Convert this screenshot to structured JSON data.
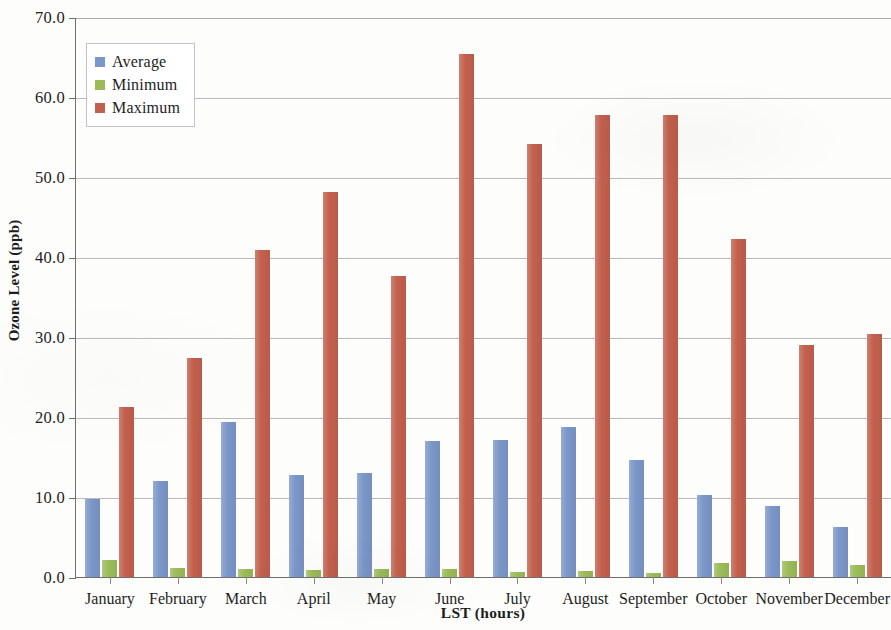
{
  "chart_data": {
    "type": "bar",
    "title": "",
    "xlabel": "LST (hours)",
    "ylabel": "Ozone Level (ppb)",
    "categories": [
      "January",
      "February",
      "March",
      "April",
      "May",
      "June",
      "July",
      "August",
      "September",
      "October",
      "November",
      "December"
    ],
    "series": [
      {
        "name": "Average",
        "color": "#7b96c9",
        "values": [
          9.7,
          12.0,
          19.4,
          12.8,
          13.0,
          17.0,
          17.1,
          18.8,
          14.6,
          10.2,
          8.9,
          6.2
        ]
      },
      {
        "name": "Minimum",
        "color": "#9bbb59",
        "values": [
          2.1,
          1.1,
          1.0,
          0.9,
          1.0,
          1.0,
          0.6,
          0.8,
          0.5,
          1.8,
          2.0,
          1.5
        ]
      },
      {
        "name": "Maximum",
        "color": "#c2604d",
        "values": [
          21.3,
          27.4,
          40.9,
          48.1,
          37.6,
          65.4,
          54.1,
          57.8,
          57.7,
          42.3,
          29.0,
          30.4
        ]
      }
    ],
    "ylim": [
      0.0,
      70.0
    ],
    "ytick_labels": [
      "70.0",
      "60.0",
      "50.0",
      "40.0",
      "30.0",
      "20.0",
      "10.0",
      "0.0"
    ],
    "ytick_values": [
      70.0,
      60.0,
      50.0,
      40.0,
      30.0,
      20.0,
      10.0,
      0.0
    ],
    "grid": true,
    "legend_position": "top-left"
  },
  "legend": {
    "items": [
      {
        "label": "Average"
      },
      {
        "label": "Minimum"
      },
      {
        "label": "Maximum"
      }
    ]
  }
}
